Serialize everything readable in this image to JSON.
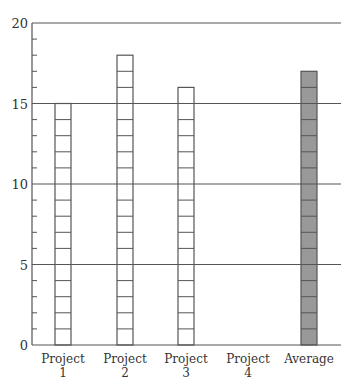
{
  "chart_data": {
    "type": "bar",
    "title": "",
    "xlabel": "",
    "ylabel": "",
    "categories": [
      "Project 1",
      "Project 2",
      "Project 3",
      "Project 4",
      "Average"
    ],
    "category_lines": [
      [
        "Project",
        "1"
      ],
      [
        "Project",
        "2"
      ],
      [
        "Project",
        "3"
      ],
      [
        "Project",
        "4"
      ],
      [
        "Average"
      ]
    ],
    "values": [
      15,
      18,
      16,
      0,
      17
    ],
    "ylim": [
      0,
      20
    ],
    "yticks_major": [
      0,
      5,
      10,
      15,
      20
    ],
    "ytick_labels": [
      "0",
      "5",
      "10",
      "15",
      "20"
    ],
    "yticks_minor_step": 1,
    "grid": {
      "horizontal_at": [
        5,
        10,
        15,
        20
      ]
    },
    "legend": null,
    "style": {
      "bar_fill": [
        "#ffffff",
        "#ffffff",
        "#ffffff",
        "#ffffff",
        "#999999"
      ],
      "bar_stroke": "#555555",
      "bars_segmented_per_unit": true,
      "axis_color": "#555555",
      "grid_color": "#555555"
    }
  }
}
